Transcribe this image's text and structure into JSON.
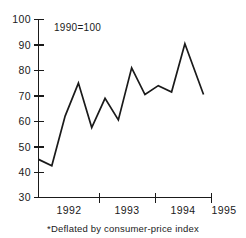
{
  "chart_data": {
    "type": "line",
    "title": "",
    "subtitle": "",
    "annotation": "1990=100",
    "footnote": "*Deflated by consumer-price index",
    "xlabel": "",
    "ylabel": "",
    "ylim": [
      30,
      100
    ],
    "xlim": [
      1991.75,
      1995.0
    ],
    "grid": false,
    "legend": false,
    "line_color": "#1a1a1a",
    "background_color": "#ffffff",
    "y_ticks": [
      30,
      40,
      50,
      60,
      70,
      80,
      90,
      100
    ],
    "y_tick_labels": [
      "30",
      "40",
      "50",
      "60",
      "70",
      "80",
      "90",
      "100"
    ],
    "x_ticks": [
      1992,
      1993,
      1994,
      1995
    ],
    "x_tick_labels": [
      "1992",
      "1993",
      "1994",
      "1995"
    ],
    "x": [
      1991.75,
      1992.0,
      1992.25,
      1992.5,
      1992.75,
      1993.0,
      1993.25,
      1993.5,
      1993.75,
      1994.0,
      1994.25,
      1994.5,
      1994.85
    ],
    "values": [
      45.0,
      42.5,
      62.0,
      75.0,
      57.5,
      69.0,
      60.5,
      81.0,
      70.5,
      74.0,
      71.5,
      90.5,
      70.5
    ],
    "series": [
      {
        "name": "index",
        "values": [
          45.0,
          42.5,
          62.0,
          75.0,
          57.5,
          69.0,
          60.5,
          81.0,
          70.5,
          74.0,
          71.5,
          90.5,
          70.5
        ]
      }
    ]
  }
}
